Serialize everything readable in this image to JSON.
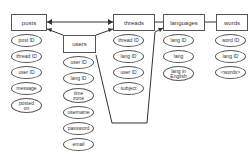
{
  "entities": {
    "posts": {
      "label": "posts",
      "attributes": [
        "post ID",
        "thread ID",
        "user ID",
        "message",
        "posted\non"
      ]
    },
    "users": {
      "label": "users",
      "attributes": [
        "user ID",
        "lang ID",
        "time\nzone",
        "username",
        "password",
        "email"
      ]
    },
    "threads": {
      "label": "threads",
      "attributes": [
        "thread ID",
        "lang ID",
        "user ID",
        "subject"
      ]
    },
    "languages": {
      "label": "languages",
      "attributes": [
        "lang ID",
        "lang",
        "lang in\nEnglish"
      ]
    },
    "words": {
      "label": "words",
      "attributes": [
        "word ID",
        "lang ID",
        "<words>"
      ]
    }
  }
}
